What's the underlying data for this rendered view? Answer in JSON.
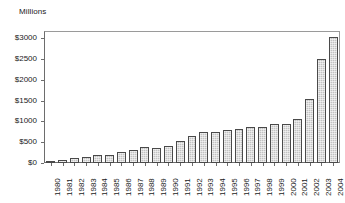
{
  "chart_data": {
    "type": "bar",
    "title": "Millions",
    "xlabel": "",
    "ylabel": "",
    "ylim": [
      0,
      3000
    ],
    "yticks": [
      0,
      500,
      1000,
      1500,
      2000,
      2500,
      3000
    ],
    "ytick_labels": [
      "$0",
      "$500",
      "$1000",
      "$1500",
      "$2000",
      "$2500",
      "$3000"
    ],
    "grid": false,
    "legend": "none",
    "bar_color": "#c2c2c2",
    "bar_edge_color": "#4a4a4a",
    "axis_color": "#6d6d6d",
    "categories": [
      "1980",
      "1981",
      "1982",
      "1983",
      "1984",
      "1985",
      "1986",
      "1987",
      "1988",
      "1989",
      "1990",
      "1991",
      "1992",
      "1993",
      "1994",
      "1995",
      "1996",
      "1997",
      "1998",
      "1999",
      "2000",
      "2001",
      "2002",
      "2003",
      "2004"
    ],
    "values": [
      60,
      70,
      110,
      155,
      185,
      185,
      275,
      315,
      380,
      370,
      400,
      525,
      650,
      740,
      735,
      790,
      820,
      855,
      875,
      935,
      940,
      1070,
      1540,
      2505,
      3030
    ]
  }
}
